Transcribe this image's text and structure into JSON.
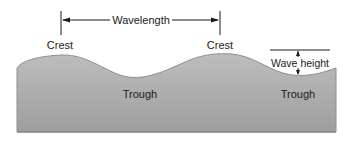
{
  "diagram": {
    "labels": {
      "wavelength": "Wavelength",
      "crest_left": "Crest",
      "crest_right": "Crest",
      "trough_left": "Trough",
      "trough_right": "Trough",
      "wave_height": "Wave height"
    },
    "colors": {
      "fill_top": "#b8b8b8",
      "fill_bottom": "#9c9c9c",
      "outline": "#8a8a8a",
      "lines": "#1a1a1a",
      "background": "#ffffff"
    }
  }
}
